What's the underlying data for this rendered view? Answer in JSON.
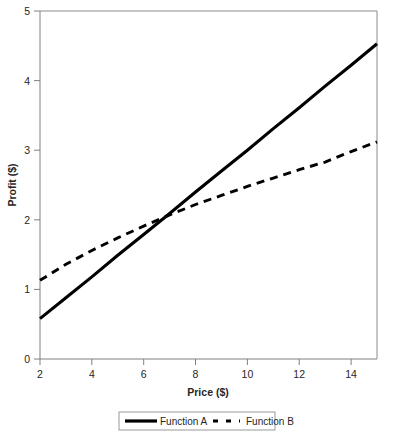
{
  "chart_data": {
    "type": "line",
    "title": "",
    "xlabel": "Price ($)",
    "ylabel": "Profit ($)",
    "xlim": [
      2,
      15
    ],
    "ylim": [
      0,
      5
    ],
    "xticks": [
      2,
      4,
      6,
      8,
      10,
      12,
      14
    ],
    "yticks": [
      0,
      1,
      2,
      3,
      4,
      5
    ],
    "xtick_labels": [
      "2",
      "4",
      "6",
      "8",
      "10",
      "12",
      "14"
    ],
    "ytick_labels": [
      "0",
      "1",
      "2",
      "3",
      "4",
      "5"
    ],
    "grid": false,
    "legend_position": "bottom-outside",
    "x": [
      2,
      3,
      4,
      5,
      6,
      7,
      8,
      9,
      10,
      11,
      12,
      13,
      14,
      15
    ],
    "series": [
      {
        "name": "Function A",
        "style": "solid",
        "color": "#000000",
        "values": [
          0.58,
          0.88,
          1.18,
          1.49,
          1.79,
          2.09,
          2.4,
          2.7,
          3.0,
          3.31,
          3.61,
          3.92,
          4.22,
          4.53
        ]
      },
      {
        "name": "Function B",
        "style": "dashed",
        "color": "#000000",
        "values": [
          1.13,
          1.36,
          1.56,
          1.74,
          1.91,
          2.07,
          2.22,
          2.35,
          2.48,
          2.6,
          2.72,
          2.83,
          2.98,
          3.12
        ]
      }
    ],
    "annotations": [],
    "intersection": {
      "x": 7.1,
      "y": 2.15
    }
  },
  "legend": {
    "items": [
      {
        "label": "Function A",
        "marker": "solid-line-swatch"
      },
      {
        "label": "Function B",
        "marker": "dashed-line-swatch"
      }
    ]
  },
  "colors": {
    "series_a": "#000000",
    "series_b": "#000000",
    "axis": "#808080",
    "frame": "#8c8c8c",
    "text": "#262626",
    "background": "#ffffff"
  }
}
